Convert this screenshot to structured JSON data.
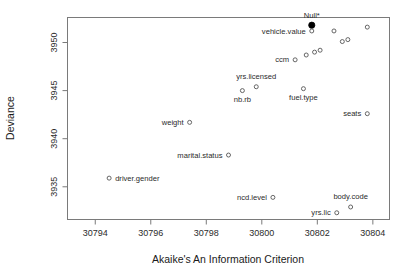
{
  "chart_data": {
    "type": "scatter",
    "title": "",
    "xlabel": "Akaike's An Information Criterion",
    "ylabel": "Deviance",
    "xlim": [
      30793.0,
      30804.6
    ],
    "ylim": [
      3931.6,
      3952.6
    ],
    "xticks": [
      30794,
      30796,
      30798,
      30800,
      30802,
      30804
    ],
    "xtick_labels": [
      "30794",
      "30796",
      "30798",
      "30800",
      "30802",
      "30804"
    ],
    "yticks": [
      3935,
      3940,
      3945,
      3950
    ],
    "ytick_labels": [
      "3935",
      "3940",
      "3945",
      "3950"
    ],
    "grid": false,
    "legend": "none",
    "box": true,
    "points": [
      {
        "label": "Null*",
        "x": 30801.8,
        "y": 3951.8,
        "marker": "filled-circle",
        "label_pos": "above"
      },
      {
        "label": "vehicle.value",
        "x": 30801.8,
        "y": 3951.2,
        "marker": "open-circle",
        "label_pos": "left"
      },
      {
        "label": "",
        "x": 30802.6,
        "y": 3951.2,
        "marker": "open-circle",
        "label_pos": "none"
      },
      {
        "label": "",
        "x": 30803.8,
        "y": 3951.6,
        "marker": "open-circle",
        "label_pos": "none"
      },
      {
        "label": "",
        "x": 30802.9,
        "y": 3950.1,
        "marker": "open-circle",
        "label_pos": "none"
      },
      {
        "label": "",
        "x": 30803.1,
        "y": 3950.3,
        "marker": "open-circle",
        "label_pos": "none"
      },
      {
        "label": "",
        "x": 30801.9,
        "y": 3949.0,
        "marker": "open-circle",
        "label_pos": "none"
      },
      {
        "label": "",
        "x": 30802.1,
        "y": 3949.2,
        "marker": "open-circle",
        "label_pos": "none"
      },
      {
        "label": "",
        "x": 30801.6,
        "y": 3948.7,
        "marker": "open-circle",
        "label_pos": "none"
      },
      {
        "label": "ccm",
        "x": 30801.2,
        "y": 3948.2,
        "marker": "open-circle",
        "label_pos": "left"
      },
      {
        "label": "yrs.licensed",
        "x": 30799.8,
        "y": 3945.4,
        "marker": "open-circle",
        "label_pos": "above"
      },
      {
        "label": "nb.rb",
        "x": 30799.3,
        "y": 3945.0,
        "marker": "open-circle",
        "label_pos": "below"
      },
      {
        "label": "fuel.type",
        "x": 30801.5,
        "y": 3945.2,
        "marker": "open-circle",
        "label_pos": "below"
      },
      {
        "label": "seats",
        "x": 30803.8,
        "y": 3942.6,
        "marker": "open-circle",
        "label_pos": "left"
      },
      {
        "label": "weight",
        "x": 30797.4,
        "y": 3941.7,
        "marker": "open-circle",
        "label_pos": "left"
      },
      {
        "label": "marital.status",
        "x": 30798.8,
        "y": 3938.3,
        "marker": "open-circle",
        "label_pos": "left"
      },
      {
        "label": "driver.gender",
        "x": 30794.5,
        "y": 3935.9,
        "marker": "open-circle",
        "label_pos": "right"
      },
      {
        "label": "ncd.level",
        "x": 30800.4,
        "y": 3933.9,
        "marker": "open-circle",
        "label_pos": "left"
      },
      {
        "label": "body.code",
        "x": 30803.2,
        "y": 3932.9,
        "marker": "open-circle",
        "label_pos": "above"
      },
      {
        "label": "yrs.lic",
        "x": 30802.7,
        "y": 3932.3,
        "marker": "open-circle",
        "label_pos": "left"
      }
    ]
  }
}
